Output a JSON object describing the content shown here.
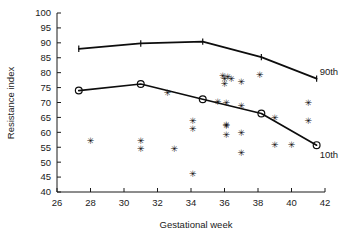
{
  "chart_data": {
    "type": "scatter",
    "title": "",
    "xlabel": "Gestational week",
    "ylabel": "Resistance index",
    "xlim": [
      26,
      42
    ],
    "ylim": [
      40,
      100
    ],
    "xticks": [
      26,
      28,
      30,
      32,
      34,
      36,
      38,
      40,
      42
    ],
    "yticks": [
      40,
      45,
      50,
      55,
      60,
      65,
      70,
      75,
      80,
      85,
      90,
      95,
      100
    ],
    "grid": false,
    "legend_position": "inline-right",
    "series": [
      {
        "name": "90th",
        "label": "90th",
        "type": "line",
        "marker": "tick",
        "points": [
          {
            "x": 27.3,
            "y": 88.0
          },
          {
            "x": 31.0,
            "y": 89.8
          },
          {
            "x": 34.7,
            "y": 90.4
          },
          {
            "x": 38.2,
            "y": 85.2
          },
          {
            "x": 41.5,
            "y": 78.0
          }
        ]
      },
      {
        "name": "10th",
        "label": "10th",
        "type": "line",
        "marker": "circle",
        "points": [
          {
            "x": 27.3,
            "y": 74.0
          },
          {
            "x": 31.0,
            "y": 76.2
          },
          {
            "x": 34.7,
            "y": 71.1
          },
          {
            "x": 38.2,
            "y": 66.3
          },
          {
            "x": 41.5,
            "y": 55.7
          }
        ]
      },
      {
        "name": "observations",
        "label": "",
        "type": "scatter",
        "marker": "asterisk",
        "points": [
          {
            "x": 28.0,
            "y": 57.2
          },
          {
            "x": 31.0,
            "y": 57.3
          },
          {
            "x": 31.0,
            "y": 54.5
          },
          {
            "x": 32.6,
            "y": 73.5
          },
          {
            "x": 33.0,
            "y": 54.5
          },
          {
            "x": 34.1,
            "y": 64.1
          },
          {
            "x": 34.1,
            "y": 61.2
          },
          {
            "x": 34.1,
            "y": 46.3
          },
          {
            "x": 35.9,
            "y": 79.2
          },
          {
            "x": 36.2,
            "y": 78.9
          },
          {
            "x": 36.0,
            "y": 78.1
          },
          {
            "x": 36.4,
            "y": 78.1
          },
          {
            "x": 36.0,
            "y": 76.3
          },
          {
            "x": 35.6,
            "y": 70.4
          },
          {
            "x": 36.1,
            "y": 70.0
          },
          {
            "x": 36.1,
            "y": 62.8
          },
          {
            "x": 36.1,
            "y": 62.2
          },
          {
            "x": 36.1,
            "y": 59.2
          },
          {
            "x": 37.0,
            "y": 77.2
          },
          {
            "x": 37.0,
            "y": 69.1
          },
          {
            "x": 37.0,
            "y": 60.1
          },
          {
            "x": 37.0,
            "y": 53.2
          },
          {
            "x": 38.1,
            "y": 79.3
          },
          {
            "x": 39.0,
            "y": 65.1
          },
          {
            "x": 39.0,
            "y": 56.0
          },
          {
            "x": 40.0,
            "y": 56.0
          },
          {
            "x": 41.0,
            "y": 70.0
          },
          {
            "x": 41.0,
            "y": 64.0
          }
        ]
      }
    ]
  }
}
